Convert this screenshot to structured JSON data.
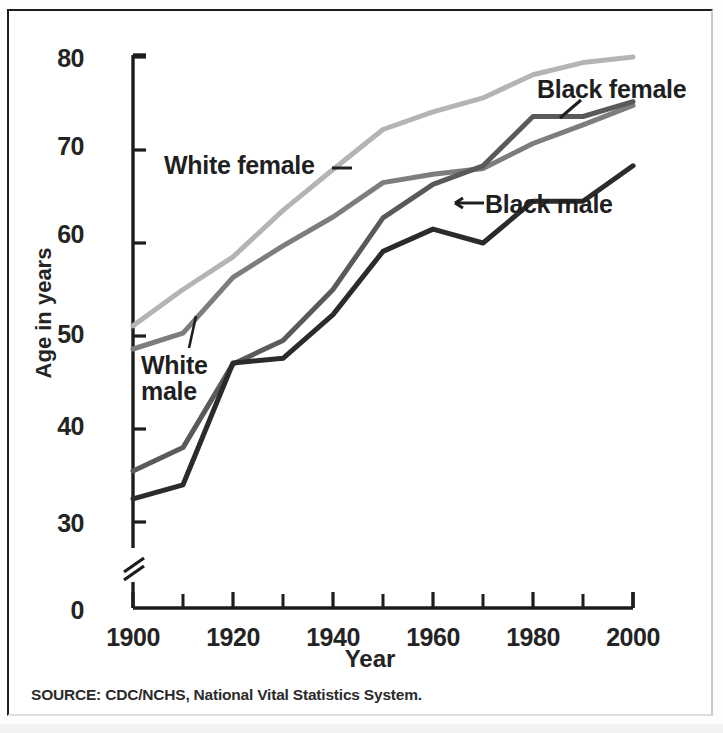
{
  "chart_data": {
    "type": "line",
    "title": "",
    "xlabel": "Year",
    "ylabel": "Age in years",
    "xlim": [
      1900,
      2000
    ],
    "ylim": [
      0,
      80
    ],
    "y_axis_break": true,
    "y_break_note": "axis broken between 0 and 30",
    "grid": false,
    "legend_position": "inline-annotations",
    "x_tick_labels": [
      "1900",
      "1920",
      "1940",
      "1960",
      "1980",
      "2000"
    ],
    "x_tick_values": [
      1900,
      1920,
      1940,
      1960,
      1980,
      2000
    ],
    "x_minor_ticks": [
      1910,
      1930,
      1950,
      1970,
      1990
    ],
    "y_tick_labels": [
      "0",
      "30",
      "40",
      "50",
      "60",
      "70",
      "80"
    ],
    "y_tick_values": [
      0,
      30,
      40,
      50,
      60,
      70,
      80
    ],
    "x": [
      1900,
      1910,
      1920,
      1930,
      1940,
      1950,
      1960,
      1970,
      1980,
      1990,
      2000
    ],
    "series": [
      {
        "name": "White female",
        "color": "#b4b4b4",
        "values": [
          51.1,
          55.0,
          58.5,
          63.5,
          67.9,
          72.2,
          74.1,
          75.6,
          78.1,
          79.4,
          80.0
        ]
      },
      {
        "name": "White male",
        "color": "#7d7d7d",
        "values": [
          48.6,
          50.3,
          56.3,
          59.7,
          62.8,
          66.5,
          67.4,
          68.0,
          70.7,
          72.7,
          74.8
        ]
      },
      {
        "name": "Black female",
        "color": "#5a5a5a",
        "values": [
          35.5,
          38.0,
          47.0,
          49.5,
          55.0,
          62.7,
          66.3,
          68.3,
          73.6,
          73.6,
          75.2
        ]
      },
      {
        "name": "Black male",
        "color": "#2b2b2b",
        "values": [
          32.5,
          34.0,
          47.1,
          47.6,
          52.3,
          59.1,
          61.5,
          60.0,
          64.5,
          64.5,
          68.3
        ]
      }
    ],
    "annotations": [
      {
        "label": "White female",
        "series": "White female",
        "leader": "dash-right"
      },
      {
        "label": "White male",
        "series": "White male",
        "leader": "line-up"
      },
      {
        "label": "Black female",
        "series": "Black female",
        "leader": "line-down-left"
      },
      {
        "label": "Black male",
        "series": "Black male",
        "leader": "arrow-left"
      }
    ]
  },
  "labels": {
    "y_axis_title": "Age in years",
    "x_axis_title": "Year",
    "white_female": "White female",
    "white_male_line1": "White",
    "white_male_line2": "male",
    "black_female": "Black female",
    "black_male": "Black male"
  },
  "source": {
    "note": "SOURCE: CDC/NCHS, National Vital Statistics System."
  },
  "colors": {
    "axis": "#1d1d1d",
    "text": "#242424",
    "white_female": "#b4b4b4",
    "white_male": "#7d7d7d",
    "black_female": "#5a5a5a",
    "black_male": "#2b2b2b",
    "background": "#ffffff"
  }
}
